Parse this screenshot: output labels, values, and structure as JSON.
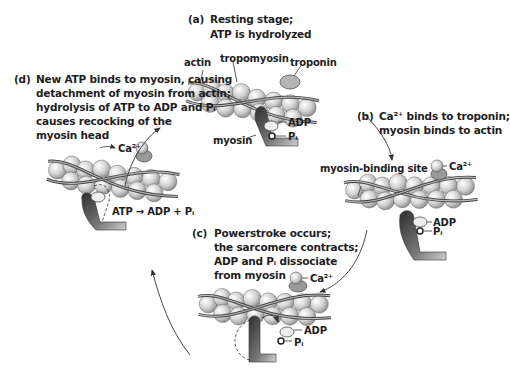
{
  "figure": {
    "stages": [
      {
        "letter": "(a)",
        "lines": [
          "Resting stage;",
          "ATP is hydrolyzed"
        ]
      },
      {
        "letter": "(b)",
        "lines": [
          "Ca²⁺ binds to troponin;",
          "myosin binds to actin"
        ]
      },
      {
        "letter": "(c)",
        "lines": [
          "Powerstroke occurs;",
          "the sarcomere contracts;",
          "ADP and Pᵢ dissociate",
          "from myosin"
        ]
      },
      {
        "letter": "(d)",
        "lines": [
          "New ATP binds to myosin, causing",
          "detachment of myosin from actin;",
          "hydrolysis of ATP to ADP and Pᵢ",
          "causes recocking of the",
          "myosin head"
        ]
      }
    ],
    "labels": {
      "actin": "actin",
      "tropomyosin": "tropomyosin",
      "troponin": "troponin",
      "myosin": "myosin",
      "adp": "ADP",
      "pi": "Pᵢ",
      "ca": "Ca²⁺",
      "binding_site": "myosin-binding site",
      "reaction": "ATP → ADP + Pᵢ"
    },
    "colors": {
      "text": "#1e1e1e",
      "sphere_light": "#e6e6e6",
      "sphere_dark": "#8a8a8a",
      "strand": "#555555",
      "myosin_dark": "#3a3a3a",
      "arrow": "#333333"
    }
  }
}
